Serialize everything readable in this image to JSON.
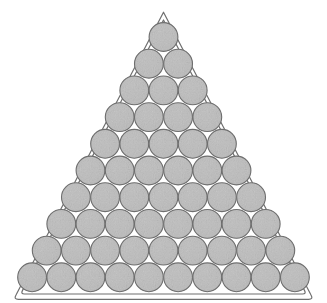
{
  "figure": {
    "kind": "triangular-circle-packing",
    "caption": "",
    "title": "",
    "background_color": "#ffffff",
    "canvas": {
      "width": 327,
      "height": 303
    },
    "frame": {
      "name": "triangle-rack-outline",
      "shape": "rounded-triangle",
      "stroke_color": "#6f6f6f",
      "stroke_width": 1.2,
      "fill": "none",
      "double_stroke": true,
      "inner_offset_px": 4.5,
      "corner_radius_px": 9,
      "apex": {
        "x": 163.5,
        "y": 13.0
      },
      "bottom_left": {
        "x": 14.0,
        "y": 296.5
      },
      "bottom_right": {
        "x": 313.0,
        "y": 296.5
      }
    },
    "circles": {
      "name": "packed-circles",
      "count_total": 55,
      "rows": 10,
      "counts_per_row": [
        1,
        2,
        3,
        4,
        5,
        6,
        7,
        8,
        9,
        10
      ],
      "radius_px": 14.4,
      "pitch_x_px": 29.2,
      "pitch_y_px": 26.7,
      "row1_center_y_px": 37.0,
      "center_x_px": 163.5,
      "fill_color": "#b9b9b9",
      "fill_color_highlight": "#c9c9c9",
      "fill_color_shadow": "#a6a6a6",
      "stroke_color": "#6e6e6e",
      "stroke_width": 1.1,
      "texture": "speckled-gray-noise"
    }
  },
  "chart_data": {
    "type": "scatter",
    "title": "",
    "xlabel": "",
    "ylabel": "",
    "grid": false,
    "legend_position": "none",
    "xlim": [
      0,
      327
    ],
    "ylim": [
      303,
      0
    ],
    "series": [
      {
        "name": "row-1",
        "row_index": 1,
        "circle_count": 1,
        "radius": 14.4,
        "x": [
          163.5
        ],
        "y": [
          37.0
        ]
      },
      {
        "name": "row-2",
        "row_index": 2,
        "circle_count": 2,
        "radius": 14.4,
        "x": [
          148.9,
          178.1
        ],
        "y": [
          63.7,
          63.7
        ]
      },
      {
        "name": "row-3",
        "row_index": 3,
        "circle_count": 3,
        "radius": 14.4,
        "x": [
          134.3,
          163.5,
          192.7
        ],
        "y": [
          90.4,
          90.4,
          90.4
        ]
      },
      {
        "name": "row-4",
        "row_index": 4,
        "circle_count": 4,
        "radius": 14.4,
        "x": [
          119.7,
          148.9,
          178.1,
          207.3
        ],
        "y": [
          117.1,
          117.1,
          117.1,
          117.1
        ]
      },
      {
        "name": "row-5",
        "row_index": 5,
        "circle_count": 5,
        "radius": 14.4,
        "x": [
          105.1,
          134.3,
          163.5,
          192.7,
          221.9
        ],
        "y": [
          143.8,
          143.8,
          143.8,
          143.8,
          143.8
        ]
      },
      {
        "name": "row-6",
        "row_index": 6,
        "circle_count": 6,
        "radius": 14.4,
        "x": [
          90.5,
          119.7,
          148.9,
          178.1,
          207.3,
          236.5
        ],
        "y": [
          170.5,
          170.5,
          170.5,
          170.5,
          170.5,
          170.5
        ]
      },
      {
        "name": "row-7",
        "row_index": 7,
        "circle_count": 7,
        "radius": 14.4,
        "x": [
          75.9,
          105.1,
          134.3,
          163.5,
          192.7,
          221.9,
          251.1
        ],
        "y": [
          197.2,
          197.2,
          197.2,
          197.2,
          197.2,
          197.2,
          197.2
        ]
      },
      {
        "name": "row-8",
        "row_index": 8,
        "circle_count": 8,
        "radius": 14.4,
        "x": [
          61.3,
          90.5,
          119.7,
          148.9,
          178.1,
          207.3,
          236.5,
          265.7
        ],
        "y": [
          223.9,
          223.9,
          223.9,
          223.9,
          223.9,
          223.9,
          223.9,
          223.9
        ]
      },
      {
        "name": "row-9",
        "row_index": 9,
        "circle_count": 9,
        "radius": 14.4,
        "x": [
          46.7,
          75.9,
          105.1,
          134.3,
          163.5,
          192.7,
          221.9,
          251.1,
          280.3
        ],
        "y": [
          250.6,
          250.6,
          250.6,
          250.6,
          250.6,
          250.6,
          250.6,
          250.6,
          250.6
        ]
      },
      {
        "name": "row-10",
        "row_index": 10,
        "circle_count": 10,
        "radius": 14.4,
        "x": [
          32.1,
          61.3,
          90.5,
          119.7,
          148.9,
          178.1,
          207.3,
          236.5,
          265.7,
          294.9
        ],
        "y": [
          277.3,
          277.3,
          277.3,
          277.3,
          277.3,
          277.3,
          277.3,
          277.3,
          277.3,
          277.3
        ]
      }
    ]
  }
}
